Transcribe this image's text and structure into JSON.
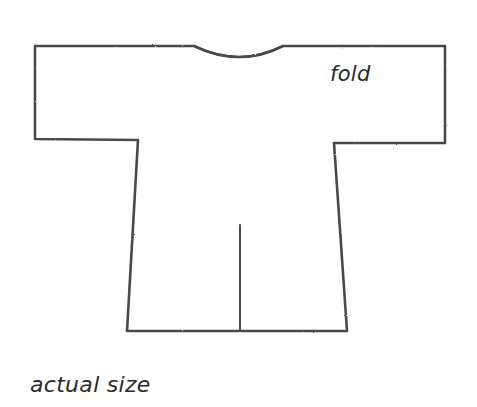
{
  "diagram": {
    "type": "garment-pattern",
    "labels": {
      "fold": "fold",
      "caption": "actual size"
    },
    "colors": {
      "background": "#ffffff",
      "stroke": "#4a4a4a",
      "text": "#2a2a2a"
    }
  }
}
